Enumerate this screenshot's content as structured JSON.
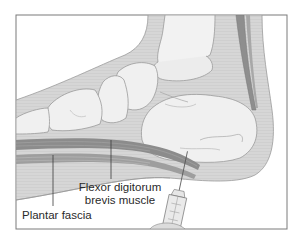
{
  "figure": {
    "colors": {
      "frame": "#7a7a7a",
      "background": "#ffffff",
      "soft_tissue": "#d4d4d4",
      "bone_fill": "#efefef",
      "bone_outline": "#9a9a9a",
      "muscle_dark": "#8c8c8c",
      "muscle_light": "#bdbdbd",
      "tendon": "#8a8a8a",
      "leader_line": "#3a3a3a",
      "label_text": "#2a2a2a"
    },
    "labels": [
      {
        "id": "flexor",
        "lines": [
          "Flexor digitorum",
          "brevis muscle"
        ]
      },
      {
        "id": "plantar",
        "lines": [
          "Plantar fascia"
        ]
      }
    ]
  },
  "labels": {
    "flexor_line1": "Flexor digitorum",
    "flexor_line2": "brevis muscle",
    "plantar": "Plantar fascia"
  }
}
